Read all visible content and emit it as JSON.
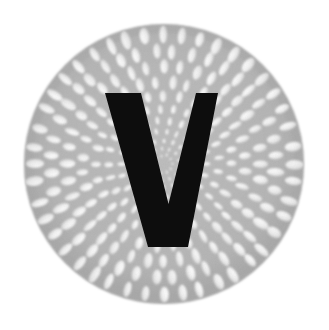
{
  "canvas": {
    "width": 329,
    "height": 330,
    "background_color": "#ffffff",
    "alt_text": "V"
  },
  "emblem": {
    "name": "radial-petal-disc-monogram",
    "description": "Circular emblem: gray disc filled with a radial sunflower-like arrangement of white elliptical petals, overlaid with a bold black letter V",
    "disc": {
      "center_x": 164,
      "center_y": 164,
      "radius": 140,
      "fill_color": "#b5b5b5",
      "rim_color": "#aaaaaa",
      "rim_width": 9,
      "edge_softness": 2
    },
    "petals": {
      "shape": "ellipse",
      "fill_color": "#f7f7f7",
      "shade_color": "#d8d8d8",
      "orientation": "radial",
      "ring_count": 11,
      "rings": [
        {
          "index": 1,
          "radius": 130,
          "count": 44,
          "petal_length": 17.0,
          "petal_width": 8.6,
          "opacity": 0.97
        },
        {
          "index": 2,
          "radius": 113,
          "count": 40,
          "petal_length": 16.0,
          "petal_width": 8.2,
          "opacity": 0.97
        },
        {
          "index": 3,
          "radius": 97,
          "count": 36,
          "petal_length": 14.6,
          "petal_width": 7.6,
          "opacity": 0.96
        },
        {
          "index": 4,
          "radius": 82,
          "count": 32,
          "petal_length": 13.0,
          "petal_width": 6.9,
          "opacity": 0.96
        },
        {
          "index": 5,
          "radius": 68,
          "count": 28,
          "petal_length": 11.4,
          "petal_width": 6.1,
          "opacity": 0.95
        },
        {
          "index": 6,
          "radius": 55,
          "count": 25,
          "petal_length": 9.8,
          "petal_width": 5.3,
          "opacity": 0.95
        },
        {
          "index": 7,
          "radius": 43,
          "count": 22,
          "petal_length": 8.2,
          "petal_width": 4.5,
          "opacity": 0.94
        },
        {
          "index": 8,
          "radius": 33,
          "count": 19,
          "petal_length": 6.8,
          "petal_width": 3.8,
          "opacity": 0.93
        },
        {
          "index": 9,
          "radius": 24,
          "count": 16,
          "petal_length": 5.4,
          "petal_width": 3.1,
          "opacity": 0.92
        },
        {
          "index": 10,
          "radius": 16,
          "count": 13,
          "petal_length": 4.2,
          "petal_width": 2.5,
          "opacity": 0.9
        },
        {
          "index": 11,
          "radius": 9,
          "count": 10,
          "petal_length": 3.2,
          "petal_width": 2.0,
          "opacity": 0.88
        }
      ]
    },
    "monogram": {
      "letter": "V",
      "fill_color": "#0d0d0d",
      "outline_points": "105,93 141,93 168.5,204 196,93 218,93 188,247 148,247",
      "top_y": 93,
      "bottom_y": 247,
      "left_x": 105,
      "right_x": 218,
      "foot_left_x": 148,
      "foot_right_x": 188
    }
  }
}
